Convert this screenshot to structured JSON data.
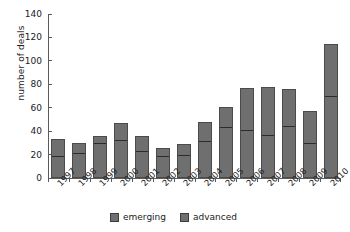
{
  "chart_data": {
    "type": "bar",
    "stacked": true,
    "title": "",
    "xlabel": "",
    "ylabel": "number of deals",
    "ylim": [
      0,
      140
    ],
    "yticks": [
      0,
      20,
      40,
      60,
      80,
      100,
      120,
      140
    ],
    "grid": false,
    "legend_position": "bottom",
    "categories": [
      "1997",
      "1998",
      "1999",
      "2000",
      "2001",
      "2002",
      "2003",
      "2004",
      "2005",
      "2006",
      "2007",
      "2008",
      "2009",
      "2010"
    ],
    "series": [
      {
        "name": "emerging",
        "color": "#6f6f6f",
        "values": [
          17,
          20,
          28,
          31,
          21,
          17,
          18,
          30,
          42,
          39,
          35,
          43,
          28,
          68
        ]
      },
      {
        "name": "advanced",
        "color": "#6f6f6f",
        "values": [
          16,
          10,
          8,
          16,
          15,
          9,
          11,
          18,
          19,
          38,
          43,
          33,
          29,
          46
        ]
      }
    ],
    "totals": [
      33,
      30,
      36,
      47,
      36,
      26,
      29,
      48,
      61,
      77,
      78,
      76,
      57,
      114
    ]
  },
  "axis": {
    "y_title": "number of deals"
  },
  "legend": {
    "items": [
      {
        "label": "emerging"
      },
      {
        "label": "advanced"
      }
    ]
  },
  "colors": {
    "bar_fill": "#6f6f6f",
    "bar_border": "#4b4b4b",
    "divider": "#2c2c2c",
    "axis": "#5a5a5a",
    "text": "#222222",
    "background": "#ffffff"
  }
}
